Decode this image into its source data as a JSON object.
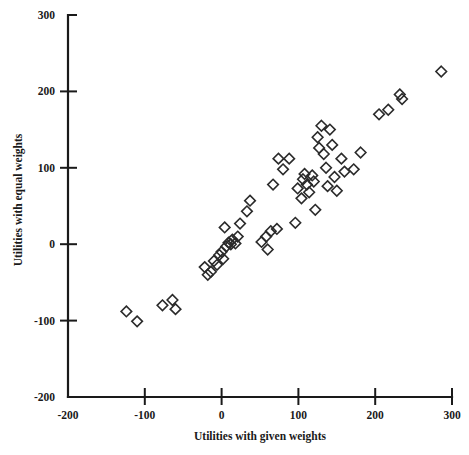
{
  "chart_data": {
    "type": "scatter",
    "title": "",
    "xlabel": "Utilities with given weights",
    "ylabel": "Utilities with equal weights",
    "xlim": [
      -200,
      300
    ],
    "ylim": [
      -200,
      300
    ],
    "xticks": [
      -200,
      -100,
      0,
      100,
      200,
      300
    ],
    "yticks": [
      -200,
      -100,
      0,
      100,
      200,
      300
    ],
    "xtick_labels": [
      "-200",
      "-100",
      "0",
      "100",
      "200",
      "300"
    ],
    "ytick_labels": [
      "-200",
      "-100",
      "0",
      "100",
      "200",
      "300"
    ],
    "grid": false,
    "legend": false,
    "marker": "open-diamond",
    "marker_size": 9,
    "series": [
      {
        "name": "observations",
        "points": [
          [
            -124,
            -88
          ],
          [
            -110,
            -101
          ],
          [
            -77,
            -80
          ],
          [
            -64,
            -73
          ],
          [
            -60,
            -85
          ],
          [
            -22,
            -30
          ],
          [
            -18,
            -40
          ],
          [
            -14,
            -36
          ],
          [
            -10,
            -22
          ],
          [
            -6,
            -27
          ],
          [
            -3,
            -14
          ],
          [
            0,
            -10
          ],
          [
            2,
            -19
          ],
          [
            4,
            22
          ],
          [
            6,
            -3
          ],
          [
            9,
            2
          ],
          [
            12,
            0
          ],
          [
            14,
            6
          ],
          [
            18,
            1
          ],
          [
            21,
            10
          ],
          [
            24,
            27
          ],
          [
            33,
            43
          ],
          [
            37,
            57
          ],
          [
            52,
            3
          ],
          [
            58,
            10
          ],
          [
            60,
            -7
          ],
          [
            64,
            17
          ],
          [
            67,
            78
          ],
          [
            72,
            20
          ],
          [
            74,
            112
          ],
          [
            80,
            98
          ],
          [
            88,
            112
          ],
          [
            96,
            28
          ],
          [
            99,
            73
          ],
          [
            104,
            60
          ],
          [
            106,
            85
          ],
          [
            108,
            92
          ],
          [
            111,
            78
          ],
          [
            114,
            68
          ],
          [
            118,
            90
          ],
          [
            120,
            82
          ],
          [
            122,
            45
          ],
          [
            125,
            140
          ],
          [
            127,
            126
          ],
          [
            130,
            155
          ],
          [
            133,
            118
          ],
          [
            136,
            100
          ],
          [
            138,
            76
          ],
          [
            141,
            150
          ],
          [
            144,
            130
          ],
          [
            147,
            88
          ],
          [
            150,
            70
          ],
          [
            156,
            112
          ],
          [
            160,
            95
          ],
          [
            172,
            98
          ],
          [
            181,
            120
          ],
          [
            205,
            170
          ],
          [
            217,
            176
          ],
          [
            232,
            196
          ],
          [
            235,
            190
          ],
          [
            286,
            226
          ]
        ]
      }
    ]
  },
  "axes": {
    "x_axis_name": "Utilities with given weights",
    "y_axis_name": "Utilities with equal weights"
  }
}
